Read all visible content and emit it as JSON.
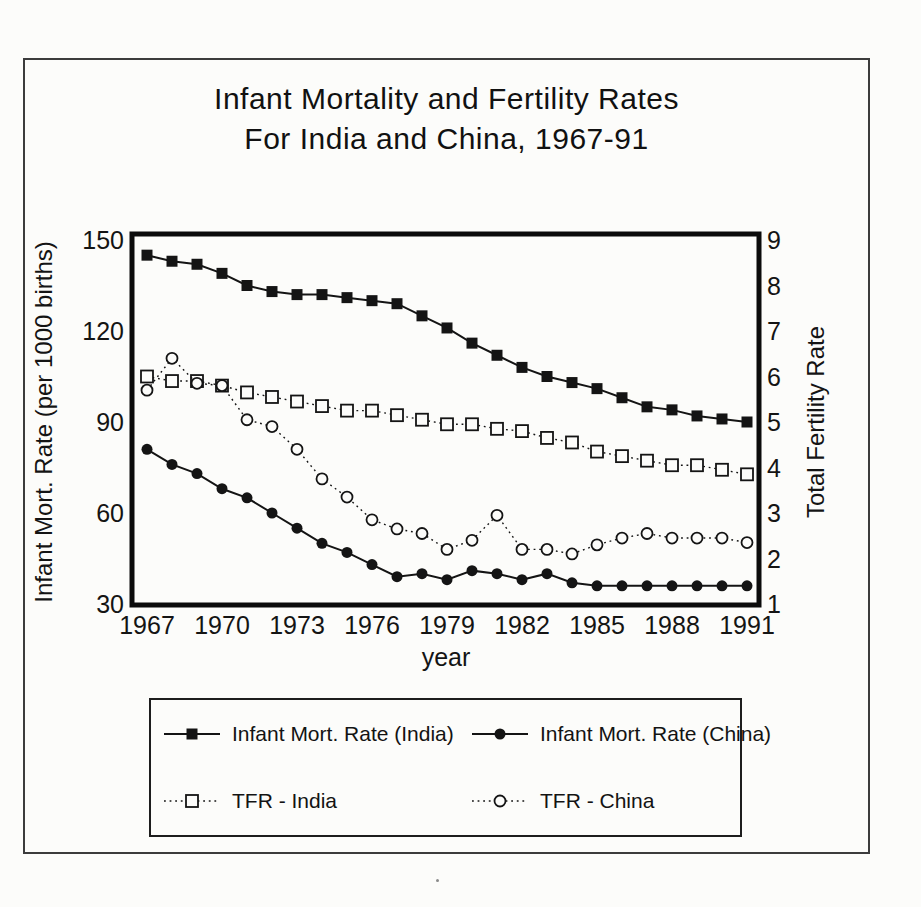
{
  "title": {
    "line1": "Infant Mortality and Fertility Rates",
    "line2": "For India and China, 1967-91"
  },
  "colors": {
    "ink": "#141414",
    "paper": "#fcfcfa",
    "frame": "#3c3c3c"
  },
  "chart_data": {
    "type": "line",
    "title": "Infant Mortality and Fertility Rates For India and China, 1967-91",
    "x": [
      1967,
      1968,
      1969,
      1970,
      1971,
      1972,
      1973,
      1974,
      1975,
      1976,
      1977,
      1978,
      1979,
      1980,
      1981,
      1982,
      1983,
      1984,
      1985,
      1986,
      1987,
      1988,
      1989,
      1990,
      1991
    ],
    "x_ticks": [
      1967,
      1970,
      1973,
      1976,
      1979,
      1982,
      1985,
      1988,
      1991
    ],
    "xlabel": "year",
    "grid": false,
    "legend_position": "bottom-box",
    "y_left": {
      "label": "Infant Mort. Rate (per 1000 births)",
      "ticks": [
        150,
        120,
        90,
        60,
        30
      ],
      "range": [
        30,
        150
      ]
    },
    "y_right": {
      "label": "Total Fertility Rate",
      "ticks": [
        9,
        8,
        7,
        6,
        5,
        4,
        3,
        2,
        1
      ],
      "range": [
        1,
        9
      ]
    },
    "series": [
      {
        "name": "Infant Mort. Rate (India)",
        "axis": "left",
        "marker": "filled-square",
        "line": "solid",
        "values": [
          145,
          143,
          142,
          139,
          135,
          133,
          132,
          132,
          131,
          130,
          129,
          125,
          121,
          116,
          112,
          108,
          105,
          103,
          101,
          98,
          95,
          94,
          92,
          91,
          90
        ]
      },
      {
        "name": "Infant Mort. Rate (China)",
        "axis": "left",
        "marker": "filled-circle",
        "line": "solid",
        "values": [
          81,
          76,
          73,
          68,
          65,
          60,
          55,
          50,
          47,
          43,
          39,
          40,
          38,
          41,
          40,
          38,
          40,
          37,
          36,
          36,
          36,
          36,
          36,
          36,
          36
        ]
      },
      {
        "name": "TFR - India",
        "axis": "right",
        "marker": "open-square",
        "line": "dotted",
        "values": [
          6.0,
          5.9,
          5.9,
          5.8,
          5.65,
          5.55,
          5.45,
          5.35,
          5.25,
          5.25,
          5.15,
          5.05,
          4.95,
          4.95,
          4.85,
          4.8,
          4.65,
          4.55,
          4.35,
          4.25,
          4.15,
          4.05,
          4.05,
          3.95,
          3.85
        ]
      },
      {
        "name": "TFR - China",
        "axis": "right",
        "marker": "open-circle",
        "line": "dotted",
        "values": [
          5.7,
          6.4,
          5.85,
          5.8,
          5.05,
          4.9,
          4.4,
          3.75,
          3.35,
          2.85,
          2.65,
          2.55,
          2.2,
          2.4,
          2.95,
          2.2,
          2.2,
          2.1,
          2.3,
          2.45,
          2.55,
          2.45,
          2.45,
          2.45,
          2.35
        ]
      }
    ]
  }
}
